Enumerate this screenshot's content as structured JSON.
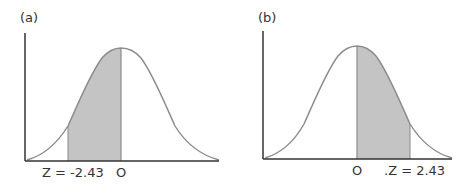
{
  "figure": {
    "panel_a": {
      "label": "(a)",
      "z_label": "Z = -2.43",
      "zero_label": "O",
      "shaded_region": "between z = -2.43 and 0"
    },
    "panel_b": {
      "label": "(b)",
      "z_label": ".Z = 2.43",
      "zero_label": "O",
      "shaded_region": "between 0 and z = 2.43"
    },
    "colors": {
      "shade": "#c4c4c4",
      "curve": "#8a8a8a",
      "axis": "#333333",
      "text": "#333333"
    }
  }
}
